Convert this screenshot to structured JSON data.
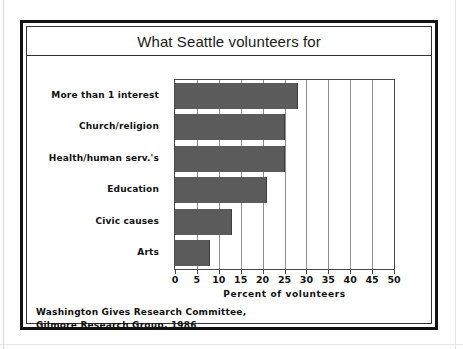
{
  "figure": {
    "title": "What Seattle volunteers for",
    "source_line_1": "Washington Gives Research Committee,",
    "source_line_2": "Gilmore Research Group, 1986",
    "bar_color": "#5b5b5b",
    "frame_color": "#121212",
    "grid_color": "#8e8e8e"
  },
  "chart_data": {
    "type": "bar",
    "orientation": "horizontal",
    "title": "What Seattle volunteers for",
    "categories": [
      "More than 1 interest",
      "Church/religion",
      "Health/human serv.'s",
      "Education",
      "Civic causes",
      "Arts"
    ],
    "values": [
      28,
      25,
      25,
      21,
      13,
      8
    ],
    "xlabel": "Percent of volunteers",
    "ylabel": "",
    "xlim": [
      0,
      50
    ],
    "xticks": [
      0,
      5,
      10,
      15,
      20,
      25,
      30,
      35,
      40,
      45,
      50
    ],
    "xtick_labels": [
      "0",
      "5",
      "10",
      "15",
      "20",
      "25",
      "30",
      "35",
      "40",
      "45",
      "50"
    ],
    "grid": "vertical",
    "legend": "none",
    "annotations": [
      "Washington Gives Research Committee,",
      "Gilmore Research Group, 1986"
    ]
  }
}
